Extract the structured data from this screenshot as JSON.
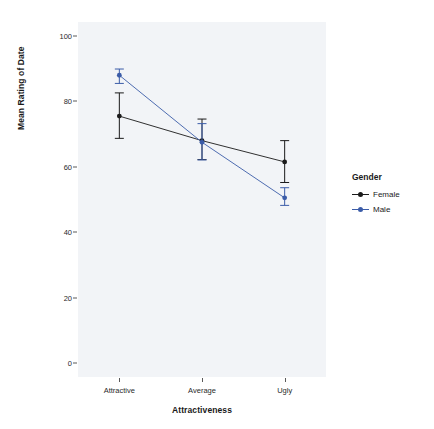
{
  "chart_data": {
    "type": "line",
    "title": "",
    "subtitle": "",
    "xlabel": "Attractiveness",
    "ylabel": "Mean Rating of Date",
    "categories": [
      "Attractive",
      "Average",
      "Ugly"
    ],
    "ylim": [
      0,
      100
    ],
    "yticks": [
      0,
      20,
      40,
      60,
      80,
      100
    ],
    "ytick_labels": [
      "0",
      "20",
      "40",
      "60",
      "80",
      "100"
    ],
    "grid": false,
    "legend_position": "right",
    "legend_title": "Gender",
    "error_bar_type": "95% confidence interval",
    "series": [
      {
        "name": "Female",
        "color": "#1a1a1a",
        "values": [
          75.5,
          68.0,
          61.5
        ],
        "error_low": [
          68.7,
          62.2,
          55.2
        ],
        "error_high": [
          82.6,
          74.6,
          68.0
        ]
      },
      {
        "name": "Male",
        "color": "#3b5ca8",
        "values": [
          88.0,
          67.5,
          50.5
        ],
        "error_low": [
          85.5,
          62.1,
          48.2
        ],
        "error_high": [
          89.9,
          73.2,
          53.6
        ]
      }
    ]
  },
  "panel": {
    "background_color": "#f2f4f7"
  },
  "legend": {
    "title": "Gender",
    "items": [
      {
        "label": "Female",
        "color": "#1a1a1a",
        "marker": "point-line-marker"
      },
      {
        "label": "Male",
        "color": "#3b5ca8",
        "marker": "point-line-marker"
      }
    ]
  },
  "axes": {
    "x_title": "Attractiveness",
    "y_title": "Mean Rating of Date",
    "x_tick_labels": [
      "Attractive",
      "Average",
      "Ugly"
    ],
    "y_tick_labels": [
      "100",
      "80",
      "60",
      "40",
      "20",
      "0"
    ]
  }
}
